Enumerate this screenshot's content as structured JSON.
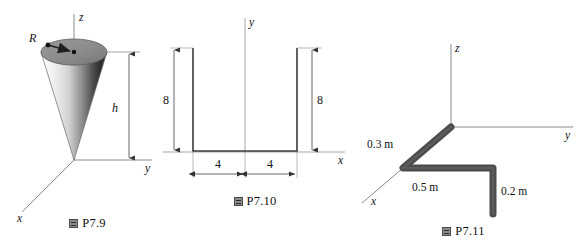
{
  "sheet": {
    "background_color": "#ffffff",
    "ink_color": "#111111",
    "axis_color": "#8a8a8a",
    "rod_color": "#4d4d4d",
    "cone_top_color": "#8d8d8d"
  },
  "figures": [
    {
      "id": "P7.9",
      "caption_glyph": "figure-cjk-glyph",
      "caption_label": "P7.9",
      "subject": "right circular cone on 3D axes, apex at origin",
      "axes": [
        {
          "name": "z-axis",
          "label": "z"
        },
        {
          "name": "y-axis",
          "label": "y"
        },
        {
          "name": "x-axis",
          "label": "x"
        }
      ],
      "dimensions": [
        {
          "name": "radius",
          "label": "R",
          "kind": "leader-arrow"
        },
        {
          "name": "height",
          "label": "h",
          "kind": "double-arrow"
        }
      ]
    },
    {
      "id": "P7.10",
      "caption_glyph": "figure-cjk-glyph",
      "caption_label": "P7.10",
      "subject": "U-shaped channel cross-section on x-y axes",
      "axes": [
        {
          "name": "y-axis",
          "label": "y"
        },
        {
          "name": "x-axis",
          "label": "x"
        }
      ],
      "dimensions": [
        {
          "name": "left-flange-height",
          "label": "8",
          "kind": "double-arrow"
        },
        {
          "name": "right-flange-height",
          "label": "8",
          "kind": "double-arrow"
        },
        {
          "name": "left-half-width",
          "label": "4",
          "kind": "double-arrow"
        },
        {
          "name": "right-half-width",
          "label": "4",
          "kind": "double-arrow"
        }
      ]
    },
    {
      "id": "P7.11",
      "caption_glyph": "figure-cjk-glyph",
      "caption_label": "P7.11",
      "subject": "bent rod of three straight segments on 3D axes",
      "axes": [
        {
          "name": "z-axis",
          "label": "z"
        },
        {
          "name": "y-axis",
          "label": "y"
        },
        {
          "name": "x-axis",
          "label": "x"
        }
      ],
      "dimensions": [
        {
          "name": "segment-x",
          "label": "0.3 m",
          "kind": "plain-text"
        },
        {
          "name": "segment-y",
          "label": "0.5 m",
          "kind": "plain-text"
        },
        {
          "name": "segment-z",
          "label": "0.2 m",
          "kind": "plain-text"
        }
      ]
    }
  ],
  "p79": {
    "axis_z": "z",
    "axis_y": "y",
    "axis_x": "x",
    "radius_label": "R",
    "height_label": "h",
    "caption": "P7.9"
  },
  "p710": {
    "axis_y": "y",
    "axis_x": "x",
    "height_left": "8",
    "height_right": "8",
    "width_left": "4",
    "width_right": "4",
    "caption": "P7.10"
  },
  "p711": {
    "axis_z": "z",
    "axis_y": "y",
    "axis_x": "x",
    "len_x": "0.3 m",
    "len_y": "0.5 m",
    "len_z": "0.2 m",
    "caption": "P7.11"
  }
}
